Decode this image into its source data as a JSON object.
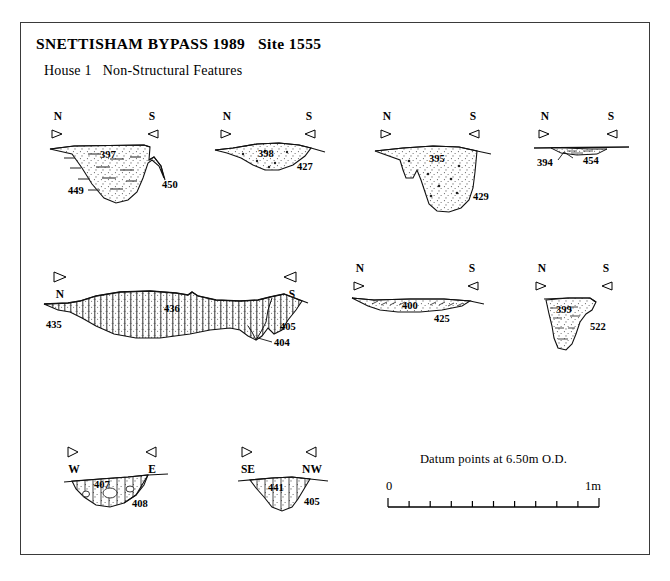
{
  "document": {
    "title_main": "SNETTISHAM BYPASS 1989   Site 1555",
    "title_sub": "House 1   Non-Structural Features"
  },
  "compass": {
    "north": "N",
    "south": "S",
    "west": "W",
    "east": "E",
    "southeast": "SE",
    "northwest": "NW",
    "marker_left_icon": "triangle-right-icon",
    "marker_right_icon": "triangle-left-icon"
  },
  "scale": {
    "caption": "Datum points at 6.50m O.D.",
    "min_label": "0",
    "max_label": "1m",
    "divisions": 10
  },
  "sections": [
    {
      "id": "section-397-449",
      "row": 1,
      "orientation_left": "N",
      "orientation_right": "S",
      "labels_position": "above-markers",
      "fill_context": "397",
      "cut_context": "449",
      "extra_context": "450",
      "fill_style": "stipple-with-dashes"
    },
    {
      "id": "section-398-427",
      "row": 1,
      "orientation_left": "N",
      "orientation_right": "S",
      "labels_position": "above-markers",
      "fill_context": "398",
      "cut_context": "427",
      "extra_context": "",
      "fill_style": "stipple-with-stones"
    },
    {
      "id": "section-395-429",
      "row": 1,
      "orientation_left": "N",
      "orientation_right": "S",
      "labels_position": "above-markers",
      "fill_context": "395",
      "cut_context": "429",
      "extra_context": "",
      "fill_style": "stipple-with-stones"
    },
    {
      "id": "section-394-454",
      "row": 1,
      "orientation_left": "N",
      "orientation_right": "S",
      "labels_position": "above-markers",
      "fill_context": "394",
      "cut_context": "454",
      "extra_context": "",
      "fill_style": "shallow-lens"
    },
    {
      "id": "section-436-435",
      "row": 2,
      "orientation_left": "N",
      "orientation_right": "S",
      "labels_position": "below-markers",
      "fill_context": "436",
      "cut_context": "435",
      "extra_context": "405",
      "extra_context_2": "404",
      "fill_style": "vertical-hatch-stipple"
    },
    {
      "id": "section-400-425",
      "row": 2,
      "orientation_left": "N",
      "orientation_right": "S",
      "labels_position": "above-markers",
      "fill_context": "400",
      "cut_context": "425",
      "extra_context": "",
      "fill_style": "stipple-with-dashes"
    },
    {
      "id": "section-399-522",
      "row": 2,
      "orientation_left": "N",
      "orientation_right": "S",
      "labels_position": "above-markers",
      "fill_context": "399",
      "cut_context": "522",
      "extra_context": "",
      "fill_style": "stipple-with-dashes"
    },
    {
      "id": "section-407-408",
      "row": 3,
      "orientation_left": "W",
      "orientation_right": "E",
      "labels_position": "below-markers",
      "fill_context": "407",
      "cut_context": "408",
      "extra_context": "",
      "fill_style": "vertical-hatch-stipple"
    },
    {
      "id": "section-441-405",
      "row": 3,
      "orientation_left": "SE",
      "orientation_right": "NW",
      "labels_position": "below-markers",
      "fill_context": "441",
      "cut_context": "405",
      "extra_context": "",
      "fill_style": "vertical-hatch-stipple"
    }
  ]
}
